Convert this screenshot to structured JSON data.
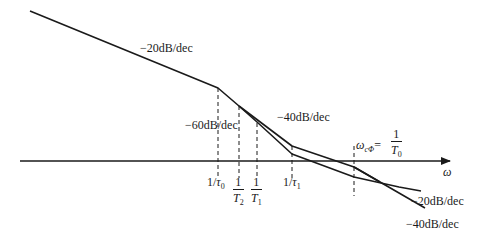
{
  "diagram": {
    "type": "bode-magnitude-asymptote",
    "axis": {
      "label": "ω"
    },
    "slopes": {
      "initial": "−20dB/dec",
      "middle_steep": "−60dB/dec",
      "middle": "−40dB/dec",
      "final_upper": "−20dB/dec",
      "final_lower": "−40dB/dec"
    },
    "breakpoints": {
      "tau0": {
        "prefix": "1/",
        "symbol": "τ",
        "sub": "0"
      },
      "T2": {
        "num": "1",
        "symbol": "T",
        "sub": "2"
      },
      "T1": {
        "num": "1",
        "symbol": "T",
        "sub": "1"
      },
      "tau1": {
        "prefix": "1/",
        "symbol": "τ",
        "sub": "1"
      }
    },
    "crossover": {
      "symbol": "ω",
      "sub": "cΦ",
      "eq": "=",
      "num": "1",
      "den_symbol": "T",
      "den_sub": "0"
    },
    "colors": {
      "line": "#1a1a1a",
      "background": "#ffffff"
    }
  }
}
